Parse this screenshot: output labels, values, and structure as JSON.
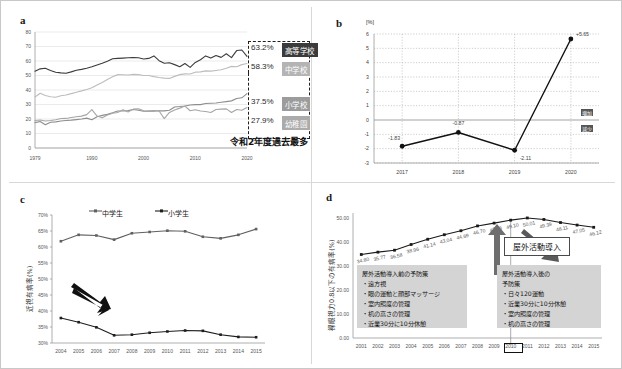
{
  "figure": {
    "width": 622,
    "height": 369
  },
  "panels": {
    "a": {
      "letter": "a",
      "ylim": [
        0,
        80
      ],
      "yticks": [
        "0",
        "10",
        "20",
        "30",
        "40",
        "50",
        "60",
        "70",
        "80"
      ],
      "xticks": [
        "1979",
        "1990",
        "2000",
        "2010",
        "2020"
      ],
      "callouts": [
        {
          "pct": "63.2%",
          "label": "高等学校",
          "shade": "#3b3b3b"
        },
        {
          "pct": "58.3%",
          "label": "中学校",
          "shade": "#9e9e9e"
        },
        {
          "pct": "37.5%",
          "label": "小学校",
          "shade": "#8c8c8c"
        },
        {
          "pct": "27.9%",
          "label": "幼稚園",
          "shade": "#a8a8a8"
        }
      ],
      "caption": "令和2年度過去最多",
      "chart_data": {
        "type": "line",
        "title": "",
        "xlabel": "",
        "ylabel": "",
        "ylim": [
          0,
          80
        ],
        "xlim": [
          1979,
          2020
        ],
        "grid": true,
        "x": [
          1979,
          1980,
          1981,
          1982,
          1983,
          1984,
          1985,
          1986,
          1987,
          1988,
          1989,
          1990,
          1991,
          1992,
          1993,
          1994,
          1995,
          1996,
          1997,
          1998,
          1999,
          2000,
          2001,
          2002,
          2003,
          2004,
          2005,
          2006,
          2007,
          2008,
          2009,
          2010,
          2011,
          2012,
          2013,
          2014,
          2015,
          2016,
          2017,
          2018,
          2019,
          2020
        ],
        "series": [
          {
            "name": "高等学校",
            "color": "#3b3b3b",
            "values": [
              53.0,
              54.6,
              55.0,
              53.5,
              52.2,
              51.8,
              51.5,
              52.5,
              53.6,
              54.2,
              55.0,
              56.0,
              57.3,
              58.4,
              59.8,
              61.5,
              61.8,
              62.0,
              62.2,
              62.4,
              62.2,
              61.4,
              61.8,
              63.5,
              60.2,
              58.4,
              58.8,
              57.5,
              56.0,
              58.3,
              55.6,
              59.0,
              60.9,
              63.5,
              62.0,
              63.8,
              62.5,
              65.0,
              62.3,
              67.2,
              67.6,
              63.2
            ]
          },
          {
            "name": "中学校",
            "color": "#bdbdbd",
            "values": [
              35.2,
              37.8,
              36.2,
              35.3,
              35.0,
              36.0,
              36.6,
              37.5,
              38.5,
              39.4,
              40.4,
              41.5,
              43.5,
              45.2,
              47.3,
              49.1,
              50.6,
              50.5,
              50.3,
              50.8,
              50.6,
              50.0,
              50.0,
              49.2,
              48.6,
              48.2,
              48.0,
              49.4,
              50.6,
              51.1,
              51.0,
              52.3,
              52.5,
              53.2,
              53.0,
              53.5,
              54.0,
              55.0,
              56.3,
              56.0,
              57.5,
              58.3
            ]
          },
          {
            "name": "小学校",
            "color": "#8e8e8e",
            "values": [
              17.5,
              18.3,
              16.0,
              17.8,
              18.0,
              18.6,
              19.0,
              19.2,
              19.6,
              20.0,
              20.6,
              19.5,
              21.5,
              22.5,
              23.2,
              24.3,
              25.5,
              25.6,
              25.8,
              26.5,
              26.0,
              25.3,
              25.5,
              25.4,
              25.7,
              25.6,
              26.0,
              28.3,
              28.6,
              29.0,
              29.7,
              29.9,
              29.9,
              30.7,
              30.9,
              31.0,
              31.5,
              32.0,
              32.5,
              34.1,
              34.6,
              37.5
            ]
          },
          {
            "name": "幼稚園",
            "color": "#a6a6a6",
            "values": [
              19.0,
              19.3,
              18.6,
              19.0,
              19.5,
              20.3,
              20.4,
              21.0,
              21.6,
              22.0,
              23.0,
              26.5,
              22.0,
              20.8,
              22.8,
              24.0,
              24.5,
              26.3,
              24.8,
              26.8,
              27.0,
              25.6,
              25.5,
              25.9,
              25.5,
              20.3,
              24.5,
              26.2,
              27.5,
              28.9,
              25.7,
              26.4,
              25.5,
              25.2,
              24.5,
              26.5,
              26.8,
              27.0,
              24.5,
              26.6,
              26.0,
              27.9
            ]
          }
        ]
      }
    },
    "b": {
      "letter": "b",
      "unit": "[%]",
      "yticks": [
        "-3",
        "-2",
        "-1",
        "0",
        "1",
        "2",
        "3",
        "4",
        "5",
        "6"
      ],
      "zero_above": "増加",
      "zero_below": "減少",
      "chart_data": {
        "type": "line",
        "title": "",
        "xlabel": "",
        "ylabel": "[%]",
        "ylim": [
          -3,
          6
        ],
        "grid": true,
        "categories": [
          "2017",
          "2018",
          "2019",
          "2020"
        ],
        "values": [
          -1.83,
          -0.87,
          -2.11,
          5.65
        ],
        "data_labels": [
          "-1.83",
          "-0.87",
          "-2.11",
          "+5.65"
        ]
      }
    },
    "c": {
      "letter": "c",
      "ylabel": "近視有病率(%)",
      "yticks": [
        "30%",
        "35%",
        "40%",
        "45%",
        "50%",
        "55%",
        "60%",
        "65%",
        "70%"
      ],
      "legend": [
        "中学生",
        "小学生"
      ],
      "chart_data": {
        "type": "line",
        "title": "",
        "xlabel": "",
        "ylabel": "近視有病率(%)",
        "ylim": [
          30,
          70
        ],
        "grid": false,
        "categories": [
          "2004",
          "2005",
          "2006",
          "2007",
          "2008",
          "2009",
          "2010",
          "2011",
          "2012",
          "2013",
          "2014",
          "2015"
        ],
        "series": [
          {
            "name": "中学生",
            "color": "#606060",
            "values": [
              61.8,
              63.8,
              63.6,
              62.3,
              64.3,
              64.7,
              65.1,
              64.9,
              63.2,
              62.7,
              63.8,
              65.6
            ]
          },
          {
            "name": "小学生",
            "color": "#1e1e1e",
            "values": [
              37.8,
              36.5,
              34.9,
              32.4,
              32.6,
              33.2,
              33.6,
              33.9,
              33.8,
              32.6,
              31.9,
              31.8
            ]
          }
        ]
      }
    },
    "d": {
      "letter": "d",
      "ylabel": "裸眼視力0.8以下の有病率(%)",
      "yticks": [
        "0.00",
        "10.00",
        "20.00",
        "30.00",
        "40.00",
        "50.00"
      ],
      "callout": "屋外活動導入",
      "highlight_year": "2010",
      "box_before": "屋外活動導入前の予防策\n・遠方視\n・眼の運動と顔部マッサージ\n・室内照度の管理\n・机の高さの管理\n・近業30分に10分休憩",
      "box_after": "屋外活動導入後の\n予防策\n・日々120運動\n・近業30分に10分休憩\n・室内照度の管理\n・机の高さの管理",
      "chart_data": {
        "type": "line",
        "title": "",
        "xlabel": "",
        "ylabel": "裸眼視力0.8以下の有病率(%)",
        "ylim": [
          0,
          50
        ],
        "grid": false,
        "categories": [
          "2001",
          "2002",
          "2003",
          "2004",
          "2005",
          "2006",
          "2007",
          "2008",
          "2009",
          "2010",
          "2011",
          "2012",
          "2013",
          "2014",
          "2015"
        ],
        "values": [
          34.8,
          35.77,
          36.58,
          38.96,
          41.14,
          43.04,
          44.69,
          46.7,
          47.86,
          49.1,
          50.01,
          49.39,
          48.11,
          47.05,
          46.12
        ],
        "data_labels": [
          "34.80",
          "35.77",
          "36.58",
          "38.96",
          "41.14",
          "43.04",
          "44.69",
          "46.70",
          "47.86",
          "49.10",
          "50.01",
          "49.39",
          "48.11",
          "47.05",
          "46.12"
        ]
      }
    }
  }
}
